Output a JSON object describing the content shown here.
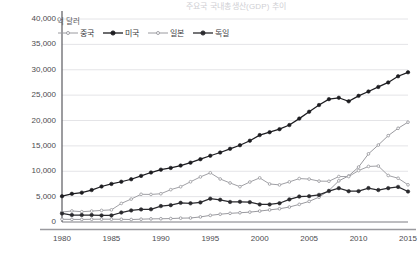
{
  "title_fragment": "주요국 국내총생산(GDP) 추이",
  "axis": {
    "y_unit_label": "억 달러",
    "y_ticks": [
      "40,000",
      "35,000",
      "30,000",
      "25,000",
      "20,000",
      "15,000",
      "10,000",
      "5,000",
      "0"
    ],
    "x_ticks": [
      "1980",
      "1985",
      "1990",
      "1995",
      "2000",
      "2005",
      "2010",
      "2015"
    ]
  },
  "legend": {
    "items": [
      {
        "label": "중국",
        "color": "#9a9a9f",
        "marker": "open-small"
      },
      {
        "label": "미국",
        "color": "#1c1c20",
        "marker": "filled"
      },
      {
        "label": "일본",
        "color": "#9a9a9f",
        "marker": "open-small"
      },
      {
        "label": "독일",
        "color": "#2a2a2e",
        "marker": "filled"
      }
    ]
  },
  "chart_data": {
    "type": "line",
    "title": "주요국 국내총생산(GDP) 추이",
    "xlabel": "",
    "ylabel": "억 달러",
    "xlim": [
      1980,
      2015
    ],
    "ylim": [
      0,
      40000
    ],
    "grid": true,
    "legend_position": "top-left",
    "x": [
      1980,
      1981,
      1982,
      1983,
      1984,
      1985,
      1986,
      1987,
      1988,
      1989,
      1990,
      1991,
      1992,
      1993,
      1994,
      1995,
      1996,
      1997,
      1998,
      1999,
      2000,
      2001,
      2002,
      2003,
      2004,
      2005,
      2006,
      2007,
      2008,
      2009,
      2010,
      2011,
      2012,
      2013,
      2014,
      2015
    ],
    "series": [
      {
        "name": "중국",
        "color": "#9a9a9f",
        "values": [
          3050,
          2900,
          2850,
          3050,
          3150,
          3100,
          3000,
          2750,
          3100,
          3470,
          3600,
          3800,
          4270,
          4440,
          5640,
          7340,
          8630,
          9610,
          10250,
          10940,
          12110,
          13390,
          14700,
          16600,
          19550,
          22860,
          27520,
          34940,
          45590,
          51100,
          60870,
          75510,
          85320,
          95700,
          103850,
          110650
        ]
      },
      {
        "name": "미국",
        "color": "#1c1c20",
        "values": [
          28570,
          31200,
          32550,
          35410,
          39330,
          42200,
          44620,
          47390,
          51080,
          54820,
          58000,
          59920,
          62530,
          65770,
          69610,
          73400,
          77000,
          81080,
          85090,
          90090,
          96300,
          99510,
          102860,
          107420,
          114580,
          122170,
          129620,
          136160,
          137670,
          133740,
          139800,
          144600,
          149700,
          154700,
          161500,
          165900
        ]
      },
      {
        "name": "일본",
        "color": "#a0a0a5",
        "values": [
          10980,
          12230,
          11420,
          12100,
          12840,
          13470,
          20580,
          25410,
          30710,
          30550,
          31320,
          35840,
          39080,
          44560,
          49980,
          54490,
          47660,
          43240,
          39150,
          44320,
          48870,
          42120,
          41150,
          44450,
          48150,
          47550,
          45300,
          45150,
          50380,
          50350,
          57000,
          61570,
          62030,
          51560,
          48500,
          41230
        ]
      },
      {
        "name": "독일",
        "color": "#2a2a2e",
        "values": [
          9460,
          7740,
          7710,
          7730,
          7310,
          7320,
          10510,
          12800,
          13990,
          14100,
          17640,
          18700,
          21230,
          20680,
          21730,
          25870,
          24600,
          22190,
          22380,
          21990,
          19490,
          19410,
          20790,
          25050,
          28190,
          28610,
          30020,
          34280,
          37520,
          34110,
          34170,
          37570,
          35440,
          37520,
          38900,
          33760
        ]
      }
    ]
  }
}
